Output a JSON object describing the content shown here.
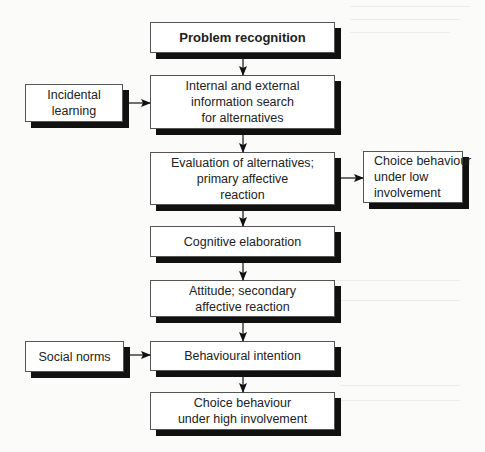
{
  "diagram": {
    "type": "flowchart",
    "nodes": {
      "problem_recognition": {
        "lines": [
          "Problem recognition"
        ]
      },
      "incidental_learning": {
        "lines": [
          "Incidental",
          "learning"
        ]
      },
      "information_search": {
        "lines": [
          "Internal and external",
          "information search",
          "for alternatives"
        ]
      },
      "evaluation": {
        "lines": [
          "Evaluation of alternatives;",
          "primary affective",
          "reaction"
        ]
      },
      "choice_low": {
        "lines": [
          "Choice behaviour",
          "under low",
          "involvement"
        ]
      },
      "cognitive_elaboration": {
        "lines": [
          "Cognitive elaboration"
        ]
      },
      "attitude": {
        "lines": [
          "Attitude; secondary",
          "affective reaction"
        ]
      },
      "social_norms": {
        "lines": [
          "Social norms"
        ]
      },
      "behavioural_intention": {
        "lines": [
          "Behavioural intention"
        ]
      },
      "choice_high": {
        "lines": [
          "Choice behaviour",
          "under high involvement"
        ]
      }
    },
    "edges": [
      {
        "from": "problem_recognition",
        "to": "information_search"
      },
      {
        "from": "incidental_learning",
        "to": "information_search"
      },
      {
        "from": "information_search",
        "to": "evaluation"
      },
      {
        "from": "evaluation",
        "to": "choice_low"
      },
      {
        "from": "evaluation",
        "to": "cognitive_elaboration"
      },
      {
        "from": "cognitive_elaboration",
        "to": "attitude"
      },
      {
        "from": "attitude",
        "to": "behavioural_intention"
      },
      {
        "from": "social_norms",
        "to": "behavioural_intention"
      },
      {
        "from": "behavioural_intention",
        "to": "choice_high"
      }
    ],
    "colors": {
      "box_fill": "#ffffff",
      "box_border": "#555555",
      "shadow": "#111111",
      "arrow": "#111111",
      "background": "#fbfbfa"
    }
  }
}
